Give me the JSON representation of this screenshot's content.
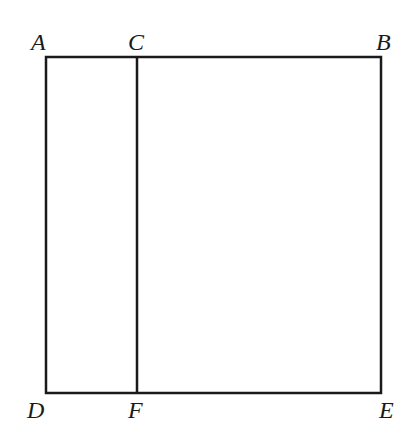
{
  "diagram": {
    "type": "geometry-figure",
    "points": [
      {
        "id": "A",
        "label": "A",
        "x": 46,
        "y": 57
      },
      {
        "id": "C",
        "label": "C",
        "x": 137,
        "y": 57
      },
      {
        "id": "B",
        "label": "B",
        "x": 381,
        "y": 57
      },
      {
        "id": "D",
        "label": "D",
        "x": 46,
        "y": 393
      },
      {
        "id": "F",
        "label": "F",
        "x": 137,
        "y": 393
      },
      {
        "id": "E",
        "label": "E",
        "x": 381,
        "y": 393
      }
    ],
    "segments": [
      {
        "from": "A",
        "to": "B"
      },
      {
        "from": "B",
        "to": "E"
      },
      {
        "from": "E",
        "to": "D"
      },
      {
        "from": "D",
        "to": "A"
      },
      {
        "from": "C",
        "to": "F"
      }
    ],
    "colors": {
      "stroke": "#1a1a1a",
      "background": "#ffffff"
    }
  },
  "labels": {
    "A": "A",
    "B": "B",
    "C": "C",
    "D": "D",
    "E": "E",
    "F": "F"
  }
}
